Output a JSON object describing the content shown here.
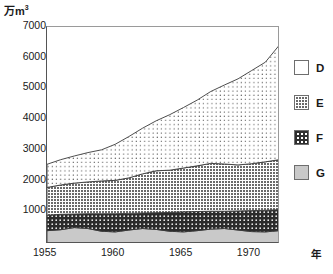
{
  "axes": {
    "y_unit_prefix": "万m",
    "y_unit_exp": "3",
    "x_unit": "年",
    "y_ticks": [
      "7000",
      "6000",
      "5000",
      "4000",
      "3000",
      "2000",
      "1000"
    ],
    "x_ticks": [
      "1955",
      "1960",
      "1965",
      "1970"
    ]
  },
  "legend": {
    "items": [
      {
        "key": "D",
        "label": "D",
        "swatch": "dots-sparse",
        "color": "#ffffff"
      },
      {
        "key": "E",
        "label": "E",
        "swatch": "grid-dense",
        "color": "#6a6a6a"
      },
      {
        "key": "F",
        "label": "F",
        "swatch": "dark-dots",
        "color": "#2e2e2e"
      },
      {
        "key": "G",
        "label": "G",
        "swatch": "solid-gray",
        "color": "#c9c9c9"
      }
    ]
  },
  "chart_data": {
    "type": "area",
    "stacked": true,
    "title": "",
    "xlabel": "年",
    "ylabel": "万m3",
    "ylim": [
      0,
      7000
    ],
    "xlim": [
      1955,
      1972
    ],
    "grid": false,
    "legend_position": "right",
    "x": [
      1955,
      1956,
      1957,
      1958,
      1959,
      1960,
      1961,
      1962,
      1963,
      1964,
      1965,
      1966,
      1967,
      1968,
      1969,
      1970,
      1971,
      1972
    ],
    "series": [
      {
        "name": "G",
        "order": 1,
        "values": [
          400,
          430,
          500,
          470,
          380,
          360,
          420,
          470,
          440,
          380,
          360,
          400,
          450,
          470,
          420,
          370,
          360,
          400
        ]
      },
      {
        "name": "F",
        "order": 2,
        "values": [
          500,
          500,
          440,
          480,
          570,
          590,
          540,
          500,
          540,
          610,
          650,
          620,
          580,
          560,
          620,
          680,
          700,
          680
        ]
      },
      {
        "name": "E",
        "order": 3,
        "values": [
          900,
          950,
          1000,
          1030,
          1060,
          1080,
          1150,
          1270,
          1360,
          1370,
          1420,
          1480,
          1550,
          1530,
          1490,
          1520,
          1570,
          1620
        ]
      },
      {
        "name": "D",
        "order": 4,
        "values": [
          750,
          820,
          880,
          950,
          1010,
          1170,
          1340,
          1480,
          1620,
          1800,
          1960,
          2130,
          2330,
          2560,
          2790,
          3020,
          3230,
          3700
        ]
      }
    ],
    "totals": [
      2550,
      2700,
      2820,
      2930,
      3020,
      3200,
      3450,
      3720,
      3960,
      4160,
      4390,
      4630,
      4910,
      5120,
      5320,
      5590,
      5860,
      6400
    ],
    "band_tops": {
      "G": [
        400,
        430,
        500,
        470,
        380,
        360,
        420,
        470,
        440,
        380,
        360,
        400,
        450,
        470,
        420,
        370,
        360,
        400
      ],
      "F": [
        900,
        930,
        940,
        950,
        950,
        950,
        960,
        970,
        980,
        990,
        1010,
        1020,
        1030,
        1030,
        1040,
        1050,
        1060,
        1080
      ],
      "E": [
        1800,
        1880,
        1940,
        1980,
        2010,
        2030,
        2110,
        2240,
        2340,
        2360,
        2430,
        2500,
        2580,
        2560,
        2530,
        2570,
        2630,
        2700
      ],
      "D": [
        2550,
        2700,
        2820,
        2930,
        3020,
        3200,
        3450,
        3720,
        3960,
        4160,
        4390,
        4630,
        4910,
        5120,
        5320,
        5590,
        5860,
        6400
      ]
    }
  }
}
